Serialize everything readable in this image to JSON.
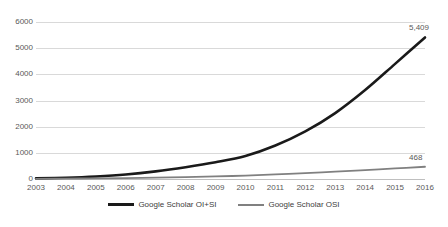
{
  "chart_data": {
    "type": "line",
    "title": "",
    "subtitle": "",
    "xlabel": "",
    "ylabel": "",
    "categories": [
      "2003",
      "2004",
      "2005",
      "2006",
      "2007",
      "2008",
      "2009",
      "2010",
      "2011",
      "2012",
      "2013",
      "2014",
      "2015",
      "2016"
    ],
    "ylim": [
      0,
      6000
    ],
    "y_ticks": [
      0,
      1000,
      2000,
      3000,
      4000,
      5000,
      6000
    ],
    "y_tick_labels": [
      "0",
      "1000",
      "2000",
      "3000",
      "4000",
      "5000",
      "6000"
    ],
    "grid": true,
    "legend_position": "bottom",
    "series": [
      {
        "name": "Google Scholar OI+SI",
        "color": "#1a1a1a",
        "width": 2.6,
        "values": [
          22,
          48,
          95,
          170,
          290,
          450,
          640,
          880,
          1280,
          1820,
          2520,
          3400,
          4400,
          5409
        ],
        "end_label": "5,409"
      },
      {
        "name": "Google Scholar OSI",
        "color": "#808080",
        "width": 1.8,
        "values": [
          8,
          15,
          24,
          36,
          52,
          72,
          98,
          130,
          175,
          225,
          280,
          340,
          405,
          468
        ],
        "end_label": "468"
      }
    ],
    "annotations": [
      {
        "text": "5,409",
        "series": "Google Scholar OI+SI",
        "category": "2016"
      },
      {
        "text": "468",
        "series": "Google Scholar OSI",
        "category": "2016"
      }
    ],
    "colors": {
      "gridline": "#d9d9d9",
      "axis": "#bfbfbf",
      "tick_text": "#595959",
      "legend_text": "#404040",
      "background": "#ffffff"
    }
  },
  "legend": {
    "items": [
      {
        "label": "Google Scholar OI+SI",
        "color": "#1a1a1a"
      },
      {
        "label": "Google Scholar OSI",
        "color": "#808080"
      }
    ]
  }
}
